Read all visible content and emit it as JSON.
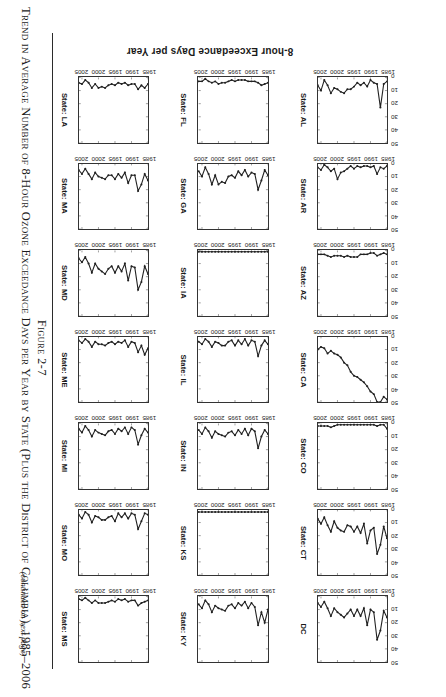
{
  "figure": {
    "number": "Figure 2-7",
    "title": "Trend in Average Number of 8-Hour Ozone Exceedance Days per Year by State (Plus the District of Columbia), 1985–2006",
    "continued_note": "(continued on next page)",
    "axis_label_y": "8-hour Exceedance Days per Year"
  },
  "chart_data": {
    "type": "line",
    "title": "Trend in Average Number of 8-Hour Ozone Exceedance Days per Year by State (Plus the District of Columbia), 1985–2006",
    "xlabel": "",
    "ylabel": "8-hour Exceedance Days per Year",
    "xlim": [
      1985,
      2006
    ],
    "ylim": [
      0,
      50
    ],
    "ytick_labels": [
      "0",
      "10",
      "20",
      "30",
      "40",
      "50"
    ],
    "ytick_values": [
      0,
      10,
      20,
      30,
      40,
      50
    ],
    "xtick_labels": [
      "1985",
      "1990",
      "1995",
      "2000",
      "2005"
    ],
    "xtick_values": [
      1985,
      1990,
      1995,
      2000,
      2005
    ],
    "grid": false,
    "legend": "none",
    "marker": "filled-circle",
    "layout": {
      "rows": 7,
      "cols": 3,
      "panel_order": "column-major"
    },
    "x": [
      1985,
      1986,
      1987,
      1988,
      1989,
      1990,
      1991,
      1992,
      1993,
      1994,
      1995,
      1996,
      1997,
      1998,
      1999,
      2000,
      2001,
      2002,
      2003,
      2004,
      2005,
      2006
    ],
    "series": [
      {
        "name": "State: AL",
        "panel_label": "State: AL",
        "column": 1,
        "row": 7,
        "values": [
          3,
          5,
          23,
          5,
          4,
          2,
          7,
          4,
          6,
          4,
          7,
          9,
          9,
          12,
          11,
          9,
          8,
          12,
          6,
          2,
          10,
          6
        ]
      },
      {
        "name": "State: AR",
        "panel_label": "State: AR",
        "column": 1,
        "row": 6,
        "values": [
          2,
          4,
          3,
          8,
          2,
          3,
          2,
          2,
          3,
          2,
          4,
          2,
          4,
          6,
          7,
          12,
          4,
          6,
          3,
          1,
          5,
          3
        ]
      },
      {
        "name": "State: AZ",
        "panel_label": "State: AZ",
        "column": 1,
        "row": 5,
        "values": [
          3,
          2,
          3,
          4,
          2,
          2,
          3,
          3,
          3,
          5,
          5,
          5,
          4,
          5,
          4,
          4,
          4,
          5,
          4,
          3,
          3,
          3
        ]
      },
      {
        "name": "State: CA",
        "panel_label": "State: CA",
        "column": 1,
        "row": 4,
        "values": [
          48,
          46,
          50,
          50,
          44,
          42,
          38,
          35,
          33,
          31,
          30,
          27,
          22,
          20,
          16,
          14,
          13,
          11,
          13,
          9,
          8,
          10
        ]
      },
      {
        "name": "State: CO",
        "panel_label": "State: CO",
        "column": 1,
        "row": 3,
        "values": [
          4,
          1,
          1,
          2,
          1,
          1,
          1,
          1,
          1,
          1,
          1,
          1,
          1,
          1,
          1,
          1,
          2,
          3,
          2,
          2,
          2,
          2
        ]
      },
      {
        "name": "State: CT",
        "panel_label": "State: CT",
        "column": 1,
        "row": 2,
        "values": [
          22,
          13,
          27,
          34,
          14,
          16,
          26,
          11,
          18,
          13,
          17,
          13,
          12,
          17,
          16,
          14,
          9,
          17,
          12,
          6,
          11,
          7
        ]
      },
      {
        "name": "DC",
        "panel_label": "DC",
        "column": 1,
        "row": 1,
        "values": [
          16,
          11,
          26,
          33,
          12,
          10,
          22,
          9,
          15,
          10,
          15,
          10,
          13,
          16,
          14,
          12,
          9,
          15,
          9,
          4,
          8,
          5
        ]
      },
      {
        "name": "State: FL",
        "panel_label": "State: FL",
        "column": 2,
        "row": 7,
        "values": [
          4,
          5,
          6,
          4,
          3,
          3,
          3,
          2,
          2,
          2,
          3,
          2,
          3,
          4,
          4,
          5,
          3,
          4,
          3,
          1,
          3,
          3
        ]
      },
      {
        "name": "State: GA",
        "panel_label": "State: GA",
        "column": 2,
        "row": 6,
        "values": [
          9,
          5,
          13,
          20,
          8,
          7,
          10,
          5,
          9,
          6,
          11,
          9,
          10,
          15,
          14,
          16,
          9,
          16,
          8,
          3,
          10,
          6
        ]
      },
      {
        "name": "State: IA",
        "panel_label": "State: IA",
        "column": 2,
        "row": 5,
        "values": [
          1,
          1,
          1,
          1,
          1,
          1,
          1,
          1,
          1,
          1,
          1,
          1,
          1,
          1,
          1,
          1,
          1,
          1,
          1,
          1,
          1,
          1
        ]
      },
      {
        "name": "State: IL",
        "panel_label": "State: IL",
        "column": 2,
        "row": 4,
        "values": [
          6,
          3,
          7,
          15,
          4,
          3,
          7,
          2,
          6,
          3,
          7,
          3,
          4,
          7,
          7,
          5,
          4,
          8,
          4,
          2,
          6,
          4
        ]
      },
      {
        "name": "State: IN",
        "panel_label": "State: IN",
        "column": 2,
        "row": 3,
        "values": [
          8,
          5,
          10,
          19,
          6,
          4,
          9,
          4,
          8,
          5,
          9,
          6,
          7,
          10,
          9,
          8,
          6,
          11,
          6,
          3,
          8,
          5
        ]
      },
      {
        "name": "State: KS",
        "panel_label": "State: KS",
        "column": 2,
        "row": 2,
        "values": [
          2,
          2,
          2,
          2,
          2,
          2,
          2,
          2,
          2,
          2,
          2,
          2,
          2,
          2,
          2,
          2,
          2,
          2,
          2,
          2,
          2,
          2
        ]
      },
      {
        "name": "State: KY",
        "panel_label": "State: KY",
        "column": 2,
        "row": 1,
        "values": [
          10,
          20,
          12,
          22,
          8,
          5,
          9,
          4,
          7,
          5,
          9,
          6,
          7,
          11,
          10,
          9,
          7,
          12,
          6,
          3,
          9,
          6
        ]
      },
      {
        "name": "State: LA",
        "panel_label": "State: LA",
        "column": 3,
        "row": 7,
        "values": [
          5,
          8,
          6,
          9,
          5,
          5,
          6,
          4,
          5,
          4,
          6,
          5,
          6,
          8,
          7,
          8,
          5,
          8,
          4,
          2,
          5,
          4
        ]
      },
      {
        "name": "State: MA",
        "panel_label": "State: MA",
        "column": 3,
        "row": 6,
        "values": [
          13,
          8,
          16,
          21,
          9,
          9,
          15,
          7,
          11,
          8,
          12,
          9,
          9,
          12,
          11,
          10,
          7,
          12,
          8,
          4,
          8,
          5
        ]
      },
      {
        "name": "State: MD",
        "panel_label": "State: MD",
        "column": 3,
        "row": 5,
        "values": [
          18,
          12,
          24,
          30,
          13,
          12,
          23,
          10,
          16,
          12,
          17,
          12,
          14,
          18,
          16,
          14,
          10,
          17,
          10,
          5,
          9,
          6
        ]
      },
      {
        "name": "State: ME",
        "panel_label": "State: ME",
        "column": 3,
        "row": 4,
        "values": [
          9,
          14,
          7,
          12,
          5,
          4,
          8,
          3,
          5,
          4,
          6,
          4,
          5,
          7,
          6,
          6,
          4,
          8,
          4,
          2,
          5,
          3
        ]
      },
      {
        "name": "State: MI",
        "panel_label": "State: MI",
        "column": 3,
        "row": 3,
        "values": [
          7,
          4,
          9,
          16,
          5,
          3,
          8,
          3,
          6,
          4,
          8,
          5,
          6,
          9,
          8,
          7,
          5,
          10,
          5,
          2,
          7,
          4
        ]
      },
      {
        "name": "State: MO",
        "panel_label": "State: MO",
        "column": 3,
        "row": 2,
        "values": [
          4,
          3,
          9,
          15,
          4,
          3,
          7,
          3,
          6,
          3,
          9,
          5,
          6,
          8,
          8,
          6,
          5,
          10,
          4,
          2,
          7,
          4
        ]
      },
      {
        "name": "State: MS",
        "panel_label": "State: MS",
        "column": 3,
        "row": 1,
        "values": [
          3,
          4,
          5,
          7,
          3,
          3,
          4,
          2,
          3,
          2,
          4,
          3,
          4,
          5,
          5,
          5,
          3,
          5,
          3,
          1,
          3,
          2
        ]
      }
    ]
  }
}
